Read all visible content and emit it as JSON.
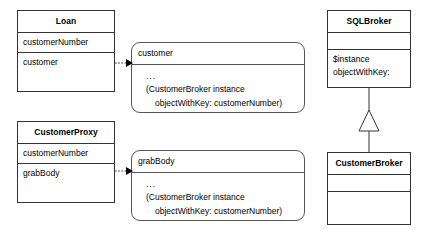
{
  "diagram": {
    "background": "#ffffff",
    "line_color": "#333333",
    "note_line_color": "#555555",
    "text_color": "#000000"
  },
  "classes": [
    {
      "key": "loan",
      "name": "Loan",
      "attributes": [
        "customerNumber",
        "customer"
      ],
      "operations": []
    },
    {
      "key": "customer_proxy",
      "name": "CustomerProxy",
      "attributes": [
        "customerNumber",
        "grabBody"
      ],
      "operations": []
    },
    {
      "key": "sql_broker",
      "name": "SQLBroker",
      "attributes": [],
      "operations": [
        "$instance",
        "objectWithKey:"
      ]
    },
    {
      "key": "customer_broker",
      "name": "CustomerBroker",
      "attributes": [],
      "operations": []
    }
  ],
  "notes": [
    {
      "key": "customer_note",
      "header": "customer",
      "lines": [
        "...",
        "(CustomerBroker instance",
        "objectWithKey: customerNumber)",
        "..."
      ]
    },
    {
      "key": "grab_body_note",
      "header": "grabBody",
      "lines": [
        "...",
        "(CustomerBroker instance",
        "objectWithKey: customerNumber)",
        "..."
      ]
    }
  ],
  "connectors": [
    {
      "key": "loan-to-customer-note",
      "style": "dotted-arrow",
      "from": "loan",
      "to": "customer_note"
    },
    {
      "key": "customerproxy-to-grabbody-note",
      "style": "dotted-arrow",
      "from": "customer_proxy",
      "to": "grab_body_note"
    },
    {
      "key": "customerbroker-inherits-sqlbroker",
      "style": "generalization",
      "from": "customer_broker",
      "to": "sql_broker"
    }
  ]
}
